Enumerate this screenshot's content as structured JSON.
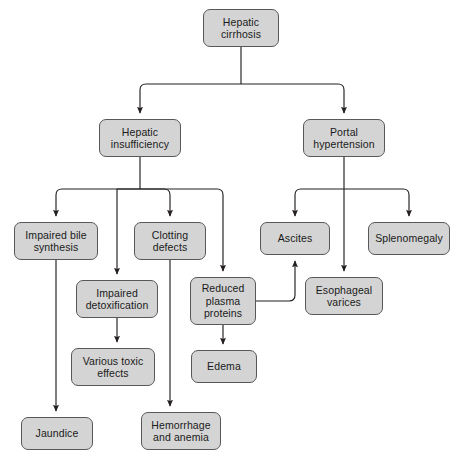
{
  "diagram": {
    "type": "flowchart",
    "background_color": "#ffffff",
    "node_fill_color": "#d4d4d4",
    "node_border_color": "#58585a",
    "edge_color": "#231f20",
    "text_color": "#1a1a1a",
    "nodes": [
      {
        "id": "hepatic-cirrhosis",
        "label": "Hepatic\ncirrhosis",
        "x": 203,
        "y": 9,
        "w": 76,
        "h": 38
      },
      {
        "id": "hepatic-insufficiency",
        "label": "Hepatic\ninsufficiency",
        "x": 99,
        "y": 119,
        "w": 82,
        "h": 38
      },
      {
        "id": "portal-hypertension",
        "label": "Portal\nhypertension",
        "x": 303,
        "y": 119,
        "w": 82,
        "h": 38
      },
      {
        "id": "impaired-bile-synthesis",
        "label": "Impaired bile\nsynthesis",
        "x": 14,
        "y": 222,
        "w": 84,
        "h": 38
      },
      {
        "id": "clotting-defects",
        "label": "Clotting\ndefects",
        "x": 134,
        "y": 222,
        "w": 72,
        "h": 38
      },
      {
        "id": "ascites",
        "label": "Ascites",
        "x": 260,
        "y": 222,
        "w": 70,
        "h": 33
      },
      {
        "id": "splenomegaly",
        "label": "Splenomegaly",
        "x": 368,
        "y": 222,
        "w": 82,
        "h": 33
      },
      {
        "id": "impaired-detoxification",
        "label": "Impaired\ndetoxification",
        "x": 76,
        "y": 280,
        "w": 82,
        "h": 38
      },
      {
        "id": "reduced-plasma-proteins",
        "label": "Reduced\nplasma\nproteins",
        "x": 190,
        "y": 277,
        "w": 66,
        "h": 48
      },
      {
        "id": "esophageal-varices",
        "label": "Esophageal\nvarices",
        "x": 305,
        "y": 277,
        "w": 78,
        "h": 38
      },
      {
        "id": "various-toxic-effects",
        "label": "Various toxic\neffects",
        "x": 71,
        "y": 348,
        "w": 84,
        "h": 38
      },
      {
        "id": "edema",
        "label": "Edema",
        "x": 191,
        "y": 350,
        "w": 66,
        "h": 33
      },
      {
        "id": "jaundice",
        "label": "Jaundice",
        "x": 21,
        "y": 417,
        "w": 72,
        "h": 33
      },
      {
        "id": "hemorrhage-and-anemia",
        "label": "Hemorrhage\nand anemia",
        "x": 141,
        "y": 412,
        "w": 80,
        "h": 38
      }
    ],
    "edges": [
      {
        "from": "hepatic-cirrhosis",
        "to": "hepatic-insufficiency"
      },
      {
        "from": "hepatic-cirrhosis",
        "to": "portal-hypertension"
      },
      {
        "from": "hepatic-insufficiency",
        "to": "impaired-bile-synthesis"
      },
      {
        "from": "hepatic-insufficiency",
        "to": "impaired-detoxification"
      },
      {
        "from": "hepatic-insufficiency",
        "to": "clotting-defects"
      },
      {
        "from": "hepatic-insufficiency",
        "to": "reduced-plasma-proteins"
      },
      {
        "from": "portal-hypertension",
        "to": "ascites"
      },
      {
        "from": "portal-hypertension",
        "to": "esophageal-varices"
      },
      {
        "from": "portal-hypertension",
        "to": "splenomegaly"
      },
      {
        "from": "impaired-bile-synthesis",
        "to": "jaundice"
      },
      {
        "from": "impaired-detoxification",
        "to": "various-toxic-effects"
      },
      {
        "from": "clotting-defects",
        "to": "hemorrhage-and-anemia"
      },
      {
        "from": "reduced-plasma-proteins",
        "to": "edema"
      },
      {
        "from": "reduced-plasma-proteins",
        "to": "ascites"
      }
    ]
  }
}
